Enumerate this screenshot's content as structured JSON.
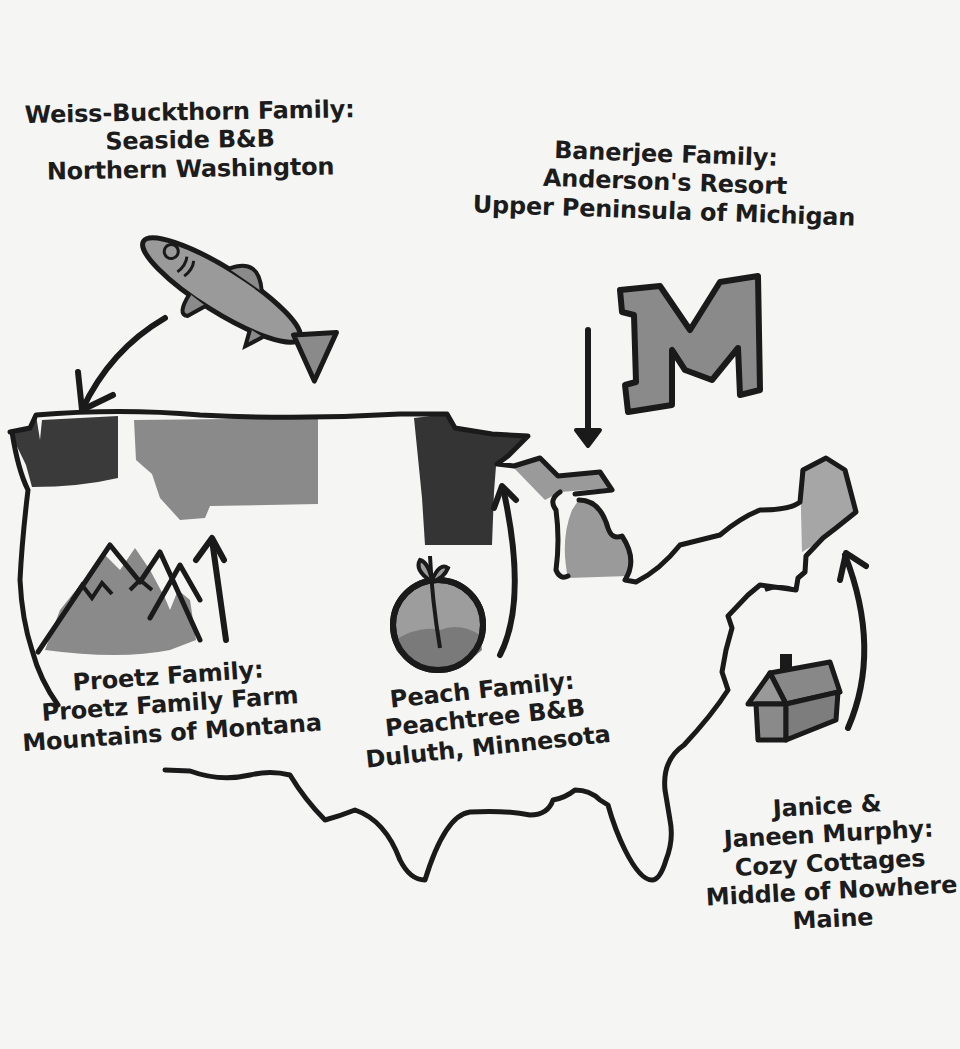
{
  "colors": {
    "background": "#f5f5f3",
    "outline": "#1a1a1a",
    "dark_fill": "#3a3a3a",
    "mid_fill": "#8e8e8e",
    "light_fill": "#a9a9a9"
  },
  "locations": [
    {
      "id": "washington",
      "family": "Weiss-Buckthorn Family:",
      "business": "Seaside B&B",
      "place": "Northern Washington",
      "icon": "fish-icon"
    },
    {
      "id": "michigan",
      "family": "Banerjee Family:",
      "business": "Anderson's Resort",
      "place": "Upper Peninsula of Michigan",
      "icon": "letter-m-icon"
    },
    {
      "id": "montana",
      "family": "Proetz Family:",
      "business": "Proetz Family Farm",
      "place": "Mountains of Montana",
      "icon": "mountains-icon"
    },
    {
      "id": "minnesota",
      "family": "Peach Family:",
      "business": "Peachtree B&B",
      "place": "Duluth, Minnesota",
      "icon": "peach-icon"
    },
    {
      "id": "maine",
      "family_line1": "Janice &",
      "family_line2": "Janeen Murphy:",
      "business": "Cozy Cottages",
      "place_line1": "Middle of Nowhere",
      "place_line2": "Maine",
      "icon": "cabin-icon"
    }
  ],
  "icon_glyphs": {
    "letter_m": "M"
  }
}
